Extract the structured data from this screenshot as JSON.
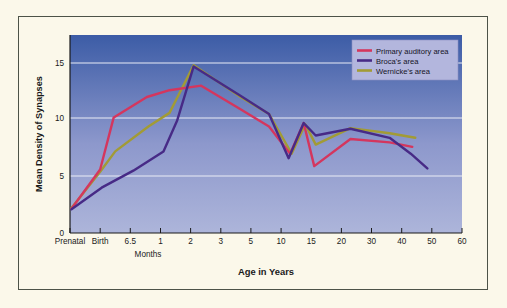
{
  "figure": {
    "background_color": "#fbf8ea",
    "border_color": "#4d5348",
    "plot_background_top": "#3f5fa8",
    "plot_background_bottom": "#a9b2d8"
  },
  "chart_data": {
    "type": "line",
    "title": "",
    "xlabel": "Age in Years",
    "ylabel": "Mean Density of Synapses",
    "sub_xlabel": "Months",
    "grid": true,
    "legend_position": "top-right",
    "ylim": [
      0,
      16.6
    ],
    "yticks": [
      0,
      5,
      10,
      15
    ],
    "ytick_labels": [
      "0",
      "5",
      "10",
      "15"
    ],
    "categories": [
      "Prenatal",
      "Birth",
      "6.5",
      "1",
      "2",
      "3",
      "5",
      "10",
      "15",
      "20",
      "30",
      "40",
      "50",
      "60"
    ],
    "xtick_labels": [
      "Prenatal",
      "Birth",
      "6.5",
      "1",
      "2",
      "3",
      "5",
      "10",
      "15",
      "20",
      "30",
      "40",
      "50",
      "60"
    ],
    "x_positions": [
      0,
      1,
      2,
      3,
      4,
      5,
      6,
      7,
      8,
      9,
      10,
      11,
      12,
      13
    ],
    "series": [
      {
        "name": "Primary auditory area",
        "color": "#d4365e",
        "points": [
          [
            0.05,
            2.15
          ],
          [
            1.0,
            5.6
          ],
          [
            1.45,
            10.2
          ],
          [
            2.55,
            12.0
          ],
          [
            3.3,
            12.6
          ],
          [
            4.35,
            13.0
          ],
          [
            5.6,
            11.0
          ],
          [
            6.6,
            9.4
          ],
          [
            7.3,
            7.0
          ],
          [
            7.75,
            9.7
          ],
          [
            8.1,
            5.9
          ],
          [
            9.3,
            8.3
          ],
          [
            10.6,
            8.0
          ],
          [
            11.35,
            7.6
          ]
        ]
      },
      {
        "name": "Broca's area",
        "color": "#472a86",
        "points": [
          [
            0.05,
            2.1
          ],
          [
            1.05,
            4.0
          ],
          [
            2.1,
            5.5
          ],
          [
            3.1,
            7.2
          ],
          [
            3.55,
            9.9
          ],
          [
            4.1,
            14.7
          ],
          [
            5.6,
            12.2
          ],
          [
            6.6,
            10.5
          ],
          [
            7.25,
            6.6
          ],
          [
            7.75,
            9.7
          ],
          [
            8.15,
            8.6
          ],
          [
            9.3,
            9.2
          ],
          [
            10.6,
            8.4
          ],
          [
            11.3,
            7.0
          ],
          [
            11.85,
            5.7
          ]
        ]
      },
      {
        "name": "Wernicke's area",
        "color": "#a29b35",
        "points": [
          [
            0.05,
            2.2
          ],
          [
            1.0,
            5.4
          ],
          [
            1.5,
            7.2
          ],
          [
            2.6,
            9.4
          ],
          [
            3.3,
            10.6
          ],
          [
            4.1,
            14.8
          ],
          [
            5.6,
            12.1
          ],
          [
            6.6,
            10.5
          ],
          [
            7.35,
            7.0
          ],
          [
            7.8,
            9.6
          ],
          [
            8.15,
            7.8
          ],
          [
            9.3,
            9.25
          ],
          [
            10.6,
            8.8
          ],
          [
            11.45,
            8.4
          ]
        ]
      }
    ]
  },
  "legend": {
    "items": [
      {
        "label": "Primary auditory area",
        "color": "#d4365e"
      },
      {
        "label": "Broca's area",
        "color": "#472a86"
      },
      {
        "label": "Wernicke's area",
        "color": "#a29b35"
      }
    ]
  }
}
